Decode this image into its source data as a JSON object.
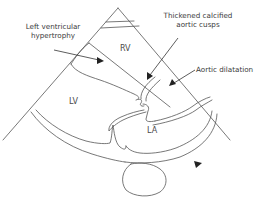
{
  "figure": {
    "type": "echocardiogram-schematic",
    "view": "parasternal long axis",
    "colors": {
      "line": "#555555",
      "arrow": "#222222",
      "text": "#3a3a3a",
      "background": "#ffffff"
    }
  },
  "annotations": {
    "lvh_line1": "Left ventricular",
    "lvh_line2": "hypertrophy",
    "cusps_line1": "Thickened calcified",
    "cusps_line2": "aortic cusps",
    "aortic_dilatation": "Aortic dilatation"
  },
  "chambers": {
    "rv": "RV",
    "lv": "LV",
    "la": "LA"
  }
}
